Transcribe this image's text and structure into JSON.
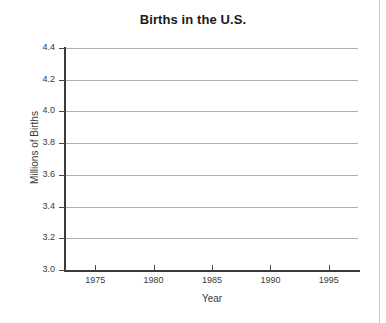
{
  "chart_data": {
    "type": "line",
    "title": "Births in the U.S.",
    "xlabel": "Year",
    "ylabel": "Millions of Births",
    "xlim": [
      1972.5,
      1997.5
    ],
    "ylim": [
      3.0,
      4.4
    ],
    "x_ticks": [
      1975,
      1980,
      1985,
      1990,
      1995
    ],
    "x_tick_labels": [
      "1975",
      "1980",
      "1985",
      "1990",
      "1995"
    ],
    "y_ticks": [
      3.0,
      3.2,
      3.4,
      3.6,
      3.8,
      4.0,
      4.2,
      4.4
    ],
    "y_tick_labels": [
      "3.0",
      "3.2",
      "3.4",
      "3.6",
      "3.8",
      "4.0",
      "4.2",
      "4.4"
    ],
    "grid": "horizontal",
    "legend": null,
    "series": [],
    "x": [],
    "values": [],
    "annotations": [],
    "note": "Empty plotting grid; no data series are drawn in the figure."
  },
  "colors": {
    "background": "#ffffff",
    "gridline": "#b0b0b0",
    "axis": "#3a3a3a",
    "title_text": "#1a1a1a",
    "label_text": "#3a3a3a",
    "page_rule": "#c9c9c9"
  }
}
